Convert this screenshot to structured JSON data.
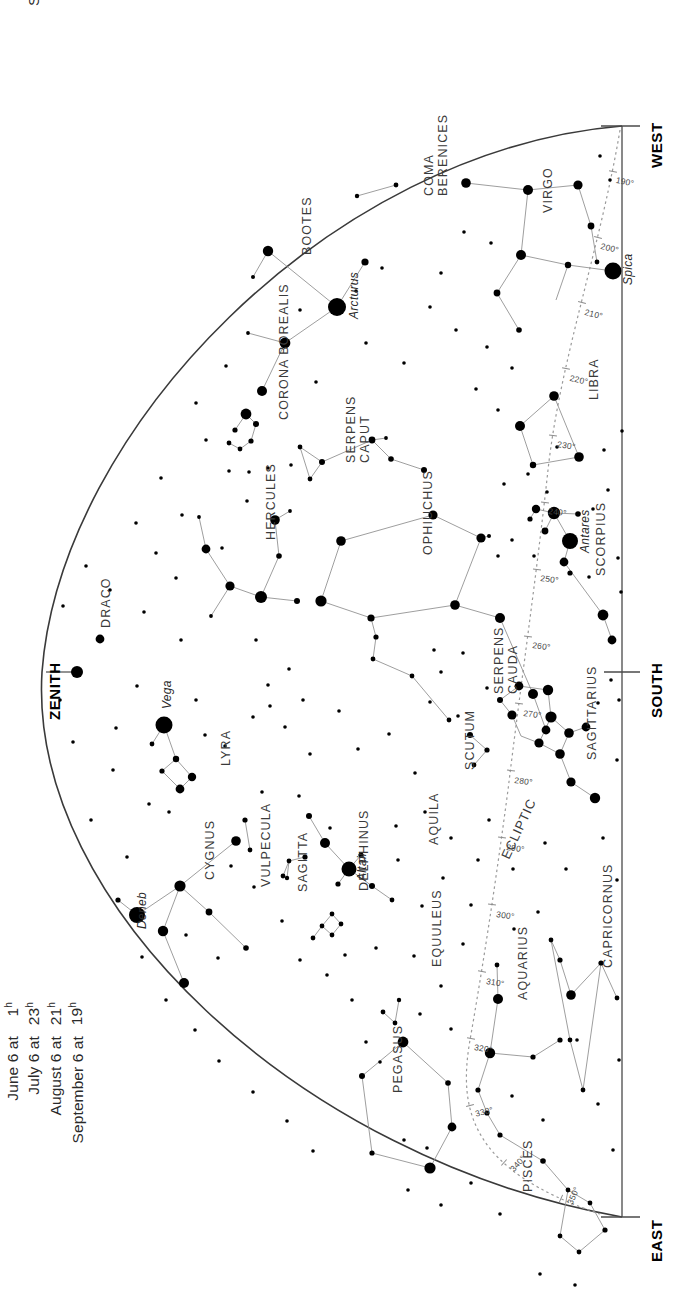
{
  "meta": {
    "orientation_note": "labels rotated 90 degrees",
    "ink": "#1a1a1a",
    "star_color": "#000000",
    "ecliptic_color": "#9a9a9a",
    "line_color": "#8c8c8c"
  },
  "legend_top": {
    "rows": [
      {
        "label": "May 21 at",
        "value": "2",
        "sup": "h"
      },
      {
        "label": "June 21 at midnight",
        "value": "",
        "sup": ""
      },
      {
        "label": "July 21 at",
        "value": "22",
        "sup": "h"
      },
      {
        "label": "August 21 at",
        "value": "20",
        "sup": "h"
      },
      {
        "label": "September 21 at",
        "value": "18",
        "sup": "h"
      }
    ]
  },
  "legend_bottom": {
    "rows": [
      {
        "label": "May 6 at",
        "value": "3",
        "sup": "h"
      },
      {
        "label": "June 6 at",
        "value": "1",
        "sup": "h"
      },
      {
        "label": "July 6 at",
        "value": "23",
        "sup": "h"
      },
      {
        "label": "August 6 at",
        "value": "21",
        "sup": "h"
      },
      {
        "label": "September 6 at",
        "value": "19",
        "sup": "h"
      }
    ]
  },
  "cardinals": [
    {
      "name": "west",
      "label": "WEST"
    },
    {
      "name": "south",
      "label": "SOUTH"
    },
    {
      "name": "east",
      "label": "EAST"
    },
    {
      "name": "zenith",
      "label": "ZENITH"
    }
  ],
  "ecliptic": {
    "label": "ECLIPTIC",
    "tick_labels": [
      "190°",
      "200°",
      "210°",
      "220°",
      "230°",
      "240°",
      "250°",
      "260°",
      "270°",
      "280°",
      "290°",
      "300°",
      "310°",
      "320°",
      "330°",
      "340°",
      "350°"
    ]
  },
  "constellations": [
    {
      "name": "COMA BERENICES",
      "x": 422,
      "y": 196,
      "rot": -90,
      "lines": 2
    },
    {
      "name": "VIRGO",
      "x": 541,
      "y": 213,
      "rot": -90,
      "lines": 1
    },
    {
      "name": "BOOTES",
      "x": 300,
      "y": 255,
      "rot": -90,
      "lines": 1
    },
    {
      "name": "LIBRA",
      "x": 587,
      "y": 400,
      "rot": -90,
      "lines": 1
    },
    {
      "name": "CORONA BOREALIS",
      "x": 277,
      "y": 420,
      "rot": -90,
      "lines": 1
    },
    {
      "name": "SERPENS CAPUT",
      "x": 344,
      "y": 463,
      "rot": -90,
      "lines": 2
    },
    {
      "name": "OPHIUCHUS",
      "x": 421,
      "y": 555,
      "rot": -90,
      "lines": 1
    },
    {
      "name": "HERCULES",
      "x": 264,
      "y": 540,
      "rot": -90,
      "lines": 1
    },
    {
      "name": "ANTARES_AREA",
      "x": 0,
      "y": 0,
      "rot": 0,
      "lines": 0
    },
    {
      "name": "SCORPIUS",
      "x": 594,
      "y": 576,
      "rot": -90,
      "lines": 1
    },
    {
      "name": "DRACO",
      "x": 99,
      "y": 628,
      "rot": -90,
      "lines": 1
    },
    {
      "name": "SERPENS CAUDA",
      "x": 492,
      "y": 694,
      "rot": -90,
      "lines": 2
    },
    {
      "name": "SCUTUM",
      "x": 463,
      "y": 770,
      "rot": -90,
      "lines": 1
    },
    {
      "name": "LYRA",
      "x": 219,
      "y": 766,
      "rot": -90,
      "lines": 1
    },
    {
      "name": "SAGITTARIUS",
      "x": 585,
      "y": 760,
      "rot": -90,
      "lines": 1
    },
    {
      "name": "AQUILA",
      "x": 427,
      "y": 845,
      "rot": -90,
      "lines": 1
    },
    {
      "name": "CYGNUS",
      "x": 203,
      "y": 880,
      "rot": -90,
      "lines": 1
    },
    {
      "name": "VULPECULA",
      "x": 259,
      "y": 887,
      "rot": -90,
      "lines": 1
    },
    {
      "name": "SAGITTA",
      "x": 296,
      "y": 892,
      "rot": -90,
      "lines": 1
    },
    {
      "name": "DELPHINUS",
      "x": 357,
      "y": 891,
      "rot": -90,
      "lines": 1
    },
    {
      "name": "CAPRICORNUS",
      "x": 601,
      "y": 968,
      "rot": -90,
      "lines": 1
    },
    {
      "name": "EQUULEUS",
      "x": 430,
      "y": 967,
      "rot": -90,
      "lines": 1
    },
    {
      "name": "AQUARIUS",
      "x": 516,
      "y": 1000,
      "rot": -90,
      "lines": 1
    },
    {
      "name": "PEGASUS",
      "x": 391,
      "y": 1093,
      "rot": -90,
      "lines": 1
    },
    {
      "name": "PISCES",
      "x": 521,
      "y": 1192,
      "rot": -90,
      "lines": 1
    }
  ],
  "named_stars": [
    {
      "name": "Arcturus",
      "x": 337,
      "y": 307,
      "mag": 1
    },
    {
      "name": "Spica",
      "x": 613,
      "y": 271,
      "mag": 1
    },
    {
      "name": "Antares",
      "x": 570,
      "y": 541,
      "mag": 1
    },
    {
      "name": "Vega",
      "x": 164,
      "y": 725,
      "mag": 1
    },
    {
      "name": "Altair",
      "x": 349,
      "y": 869,
      "mag": 1
    },
    {
      "name": "Deneb",
      "x": 137,
      "y": 915,
      "mag": 1
    }
  ],
  "chart_data": {
    "type": "scatter",
    "xlabel": "",
    "ylabel": "",
    "projection": "half-dome horizon map, rotated 90°",
    "horizon": {
      "from": "WEST",
      "through": "SOUTH",
      "to": "EAST"
    },
    "ecliptic_degrees": [
      190,
      200,
      210,
      220,
      230,
      240,
      250,
      260,
      270,
      280,
      290,
      300,
      310,
      320,
      330,
      340,
      350
    ],
    "constellation_count": 24,
    "named_star_count": 6,
    "magnitude_classes": [
      {
        "class": 1,
        "radius_px": 9,
        "description": "first magnitude"
      },
      {
        "class": 2,
        "radius_px": 6,
        "description": "second magnitude"
      },
      {
        "class": 3,
        "radius_px": 4.2,
        "description": "third magnitude"
      },
      {
        "class": 4,
        "radius_px": 2.6,
        "description": "fourth magnitude"
      },
      {
        "class": 5,
        "radius_px": 1.7,
        "description": "fifth magnitude"
      }
    ]
  }
}
